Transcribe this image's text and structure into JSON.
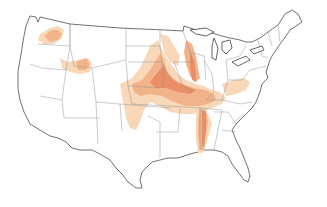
{
  "map": {
    "region": "Contiguous United States",
    "colors": {
      "background": "#ffffff",
      "land": "#ffffff",
      "border": "#333333",
      "state_lines": "#8a8a8a",
      "range_light": "#f8d8b8",
      "range_medium": "#f2b38a",
      "range_dark": "#e98e66"
    },
    "legend": [
      {
        "level": "light",
        "color": "#f8d8b8"
      },
      {
        "level": "medium",
        "color": "#f2b38a"
      },
      {
        "level": "dark",
        "color": "#e98e66"
      }
    ],
    "shaded_areas": [
      "northern-idaho-eastern-washington",
      "southern-idaho-snake-river",
      "central-plains-kansas-nebraska",
      "missouri-river-corridor",
      "mississippi-river-corridor",
      "western-minnesota-dakotas",
      "ohio-valley"
    ]
  }
}
